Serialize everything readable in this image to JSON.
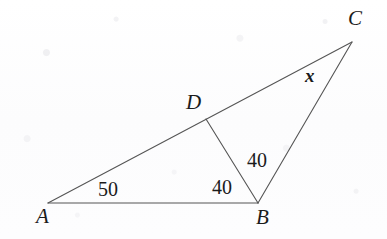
{
  "figure": {
    "kind": "euclidean-geometry-diagram",
    "stroke_color": "#555555",
    "text_color": "#1b1b1b",
    "background_color": "#fdfdfd",
    "stroke_width": 1.1,
    "width": 387,
    "height": 239
  },
  "points": {
    "A": {
      "label": "A",
      "x": 48,
      "y": 203,
      "label_x": 36,
      "label_y": 206
    },
    "B": {
      "label": "B",
      "x": 258,
      "y": 203,
      "label_x": 256,
      "label_y": 207
    },
    "C": {
      "label": "C",
      "x": 352,
      "y": 42,
      "label_x": 348,
      "label_y": 8
    },
    "D": {
      "label": "D",
      "x": 206,
      "y": 119,
      "label_x": 186,
      "label_y": 92
    }
  },
  "segments": [
    {
      "name": "segment-AB",
      "from": "A",
      "to": "B"
    },
    {
      "name": "segment-AC",
      "from": "A",
      "to": "C"
    },
    {
      "name": "segment-BC",
      "from": "B",
      "to": "C"
    },
    {
      "name": "segment-DB",
      "from": "D",
      "to": "B"
    }
  ],
  "angle_labels": [
    {
      "name": "angle-A",
      "at_vertex": "A",
      "text": "50",
      "x": 98,
      "y": 179,
      "kind": "number"
    },
    {
      "name": "angle-DBA",
      "at_vertex": "B",
      "text": "40",
      "x": 212,
      "y": 177,
      "kind": "number"
    },
    {
      "name": "angle-DBC",
      "at_vertex": "B",
      "text": "40",
      "x": 247,
      "y": 150,
      "kind": "number"
    },
    {
      "name": "angle-BCD",
      "at_vertex": "C",
      "text": "x",
      "x": 305,
      "y": 66,
      "kind": "unknown"
    }
  ]
}
